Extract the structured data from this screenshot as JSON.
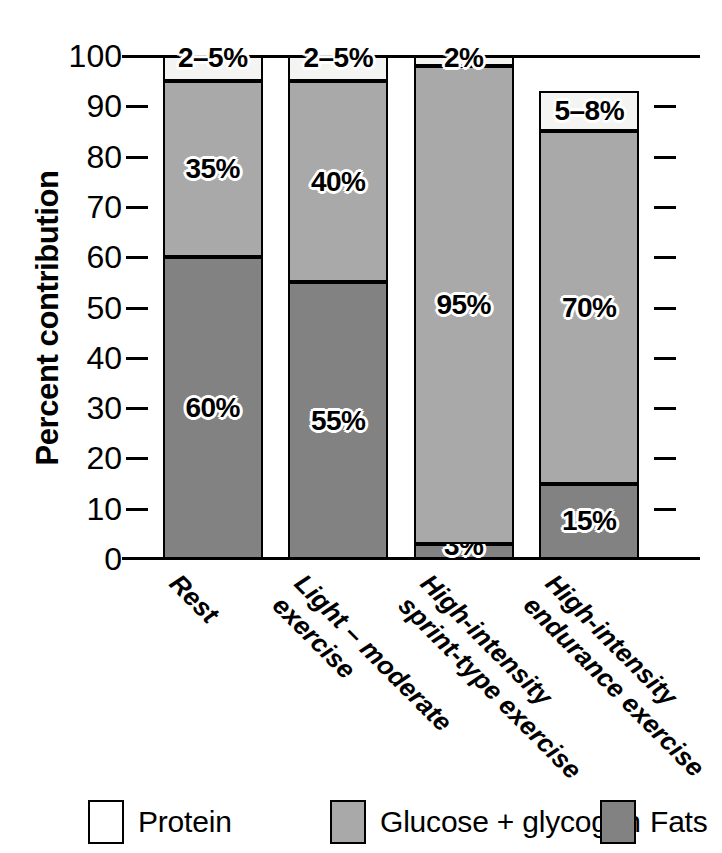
{
  "chart_data": {
    "type": "bar",
    "subtype": "stacked-bar-100",
    "title": "",
    "xlabel": "",
    "ylabel": "Percent contribution",
    "ylim": [
      0,
      100
    ],
    "ytick_values": [
      0,
      10,
      20,
      30,
      40,
      50,
      60,
      70,
      80,
      90,
      100
    ],
    "ytick_labels": [
      "0",
      "10",
      "20",
      "30",
      "40",
      "50",
      "60",
      "70",
      "80",
      "90",
      "100"
    ],
    "grid": false,
    "legend_position": "bottom",
    "categories": [
      "Rest",
      "Light – moderate exercise",
      "High-intensity sprint-type exercise",
      "High-intensity endurance exercise"
    ],
    "category_lines": [
      [
        "Rest"
      ],
      [
        "Light – moderate",
        "exercise"
      ],
      [
        "High-intensity",
        "sprint-type exercise"
      ],
      [
        "High-intensity",
        "endurance exercise"
      ]
    ],
    "series": [
      {
        "name": "Fats",
        "color": "#828282",
        "values": [
          60,
          55,
          3,
          15
        ],
        "labels": [
          "60%",
          "55%",
          "3%",
          "15%"
        ]
      },
      {
        "name": "Glucose + glycogen",
        "color": "#a9a9a9",
        "values": [
          35,
          40,
          95,
          70
        ],
        "labels": [
          "35%",
          "40%",
          "95%",
          "70%"
        ]
      },
      {
        "name": "Protein",
        "color": "#f4f4f2",
        "values": [
          5,
          5,
          2,
          8
        ],
        "labels": [
          "2–5%",
          "2–5%",
          "2%",
          "5–8%"
        ]
      }
    ],
    "legend": [
      {
        "label": "Protein",
        "color": "#f4f4f2",
        "swatch": "protein"
      },
      {
        "label": "Glucose + glycogen",
        "color": "#a9a9a9",
        "swatch": "glucose"
      },
      {
        "label": "Fats",
        "color": "#828282",
        "swatch": "fats"
      }
    ]
  },
  "axis": {
    "y_title": "Percent contribution"
  }
}
